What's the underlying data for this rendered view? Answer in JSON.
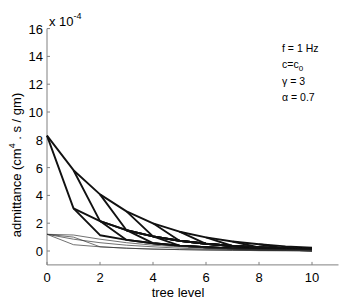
{
  "chart_data": {
    "type": "line",
    "title": "",
    "xlabel": "tree level",
    "ylabel": "admittance (cm4 . s / gm)",
    "ylabel_parts": {
      "pre": "admittance (cm",
      "sup": "4",
      "post": " . s / gm)"
    },
    "y_exponent_label": {
      "base": "x 10",
      "exp": "-4"
    },
    "xlim": [
      0,
      11
    ],
    "ylim": [
      -1,
      16
    ],
    "x_ticks": [
      0,
      2,
      4,
      6,
      8,
      10
    ],
    "y_ticks": [
      0,
      2,
      4,
      6,
      8,
      10,
      12,
      14,
      16
    ],
    "grid": false,
    "legend": null,
    "annotations": [
      {
        "text": "f = 1 Hz"
      },
      {
        "text": "c=c",
        "sub": "0"
      },
      {
        "text": "γ = 3"
      },
      {
        "text": "α = 0.7"
      }
    ],
    "series": [
      {
        "name": "upper envelope",
        "style": "thick",
        "x": [
          0,
          1,
          2,
          3,
          4,
          5,
          6,
          7,
          8,
          9,
          10
        ],
        "values": [
          8.3,
          5.81,
          4.07,
          2.85,
          1.99,
          1.39,
          0.98,
          0.68,
          0.48,
          0.33,
          0.23
        ]
      },
      {
        "name": "branch 1",
        "style": "thick",
        "x": [
          0,
          1,
          2,
          3,
          4,
          5,
          6,
          7,
          8,
          9,
          10
        ],
        "values": [
          8.3,
          3.07,
          2.15,
          1.5,
          1.05,
          0.74,
          0.52,
          0.36,
          0.25,
          0.18,
          0.12
        ]
      },
      {
        "name": "branch 2",
        "style": "thick",
        "x": [
          1,
          2,
          3,
          4,
          5,
          6,
          7,
          8,
          9,
          10
        ],
        "values": [
          5.81,
          2.15,
          1.5,
          1.05,
          0.74,
          0.52,
          0.36,
          0.25,
          0.18,
          0.12
        ]
      },
      {
        "name": "branch 3",
        "style": "thick",
        "x": [
          2,
          3,
          4,
          5,
          6,
          7,
          8,
          9,
          10
        ],
        "values": [
          4.07,
          1.5,
          1.05,
          0.74,
          0.52,
          0.36,
          0.25,
          0.18,
          0.12
        ]
      },
      {
        "name": "branch 4",
        "style": "thick",
        "x": [
          3,
          4,
          5,
          6,
          7,
          8,
          9,
          10
        ],
        "values": [
          2.85,
          1.05,
          0.74,
          0.52,
          0.36,
          0.25,
          0.18,
          0.12
        ]
      },
      {
        "name": "branch 5",
        "style": "thick",
        "x": [
          4,
          5,
          6,
          7,
          8,
          9,
          10
        ],
        "values": [
          1.99,
          0.74,
          0.52,
          0.36,
          0.25,
          0.18,
          0.12
        ]
      },
      {
        "name": "branch 6",
        "style": "thick",
        "x": [
          5,
          6,
          7,
          8,
          9,
          10
        ],
        "values": [
          1.39,
          0.52,
          0.36,
          0.25,
          0.18,
          0.12
        ]
      },
      {
        "name": "branch 7",
        "style": "thick",
        "x": [
          6,
          7,
          8,
          9,
          10
        ],
        "values": [
          0.98,
          0.36,
          0.25,
          0.18,
          0.12
        ]
      },
      {
        "name": "branch 8",
        "style": "thick",
        "x": [
          7,
          8,
          9,
          10
        ],
        "values": [
          0.68,
          0.25,
          0.18,
          0.12
        ]
      },
      {
        "name": "branch 9",
        "style": "thick",
        "x": [
          8,
          9,
          10
        ],
        "values": [
          0.48,
          0.18,
          0.12
        ]
      },
      {
        "name": "lower 1",
        "style": "thick",
        "x": [
          1,
          2,
          3,
          4,
          5,
          6,
          7,
          8,
          9,
          10
        ],
        "values": [
          3.07,
          1.14,
          0.8,
          0.56,
          0.39,
          0.27,
          0.19,
          0.13,
          0.09,
          0.06
        ]
      },
      {
        "name": "lower 2",
        "style": "thick",
        "x": [
          2,
          3,
          4,
          5,
          6,
          7,
          8,
          9,
          10
        ],
        "values": [
          2.15,
          0.8,
          0.56,
          0.39,
          0.27,
          0.19,
          0.13,
          0.09,
          0.06
        ]
      },
      {
        "name": "lower 3",
        "style": "thick",
        "x": [
          3,
          4,
          5,
          6,
          7,
          8,
          9,
          10
        ],
        "values": [
          1.5,
          0.56,
          0.39,
          0.27,
          0.19,
          0.13,
          0.09,
          0.06
        ]
      },
      {
        "name": "lower 4",
        "style": "thick",
        "x": [
          4,
          5,
          6,
          7,
          8,
          9,
          10
        ],
        "values": [
          1.05,
          0.39,
          0.27,
          0.19,
          0.13,
          0.09,
          0.06
        ]
      },
      {
        "name": "thin 1",
        "style": "thin",
        "x": [
          0,
          1,
          2,
          3,
          4,
          5,
          6,
          7,
          8,
          9,
          10
        ],
        "values": [
          1.2,
          1.15,
          0.85,
          0.6,
          0.42,
          0.3,
          0.2,
          0.14,
          0.1,
          0.07,
          0.05
        ]
      },
      {
        "name": "thin 2",
        "style": "thin",
        "x": [
          0,
          1,
          2,
          3,
          4,
          5,
          6,
          7,
          8,
          9,
          10
        ],
        "values": [
          1.2,
          0.85,
          0.6,
          0.42,
          0.3,
          0.2,
          0.14,
          0.1,
          0.07,
          0.05,
          0.03
        ]
      },
      {
        "name": "thin 3",
        "style": "thin",
        "x": [
          0,
          1,
          2,
          3,
          4,
          5,
          6,
          7,
          8,
          9,
          10
        ],
        "values": [
          1.2,
          0.45,
          0.3,
          0.2,
          0.14,
          0.1,
          0.07,
          0.05,
          0.03,
          0.02,
          0.01
        ]
      },
      {
        "name": "thin 4",
        "style": "thin",
        "x": [
          0,
          1,
          2,
          3,
          4,
          5,
          6,
          7,
          8,
          9,
          10
        ],
        "values": [
          1.2,
          1.0,
          0.3,
          0.2,
          0.14,
          0.1,
          0.07,
          0.05,
          0.03,
          0.02,
          0.01
        ]
      }
    ],
    "colors": {
      "line": "#111111",
      "thin_line": "#333333",
      "axis": "#808080"
    }
  }
}
